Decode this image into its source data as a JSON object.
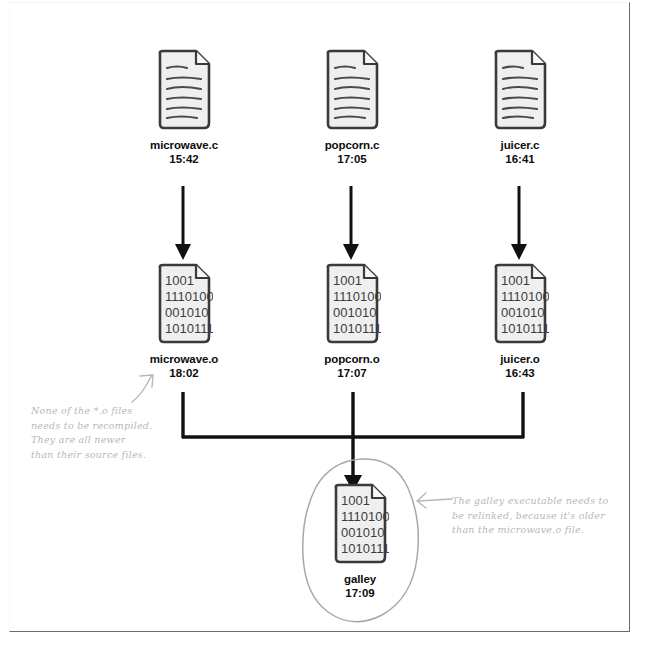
{
  "diagram": {
    "binary_lines": [
      "1001",
      "1110100",
      "001010",
      "1010111"
    ],
    "source_files": [
      {
        "name": "microwave.c",
        "time": "15:42",
        "icon": "text-document-icon"
      },
      {
        "name": "popcorn.c",
        "time": "17:05",
        "icon": "text-document-icon"
      },
      {
        "name": "juicer.c",
        "time": "16:41",
        "icon": "text-document-icon"
      }
    ],
    "object_files": [
      {
        "name": "microwave.o",
        "time": "18:02",
        "icon": "binary-document-icon"
      },
      {
        "name": "popcorn.o",
        "time": "17:07",
        "icon": "binary-document-icon"
      },
      {
        "name": "juicer.o",
        "time": "16:43",
        "icon": "binary-document-icon"
      }
    ],
    "executable": {
      "name": "galley",
      "time": "17:09",
      "icon": "binary-document-icon"
    },
    "annotations": [
      {
        "id": "object-files-note",
        "lines": [
          "None of the *.o files",
          "needs to be recompiled.",
          "They are all newer",
          "than their source files."
        ]
      },
      {
        "id": "galley-note",
        "lines": [
          "The galley executable needs to",
          "be relinked, because it's older",
          "than the microwave.o file."
        ]
      }
    ],
    "colors": {
      "ink": "#1a1a1a",
      "paper": "#ffffff",
      "doc_fill": "#efefef",
      "handwriting": "#b9b7b4",
      "frame": "#6b6b6b"
    }
  }
}
